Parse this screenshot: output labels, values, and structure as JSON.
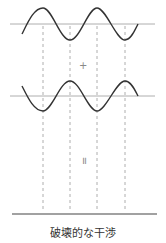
{
  "title": "破壊的な干渉",
  "operators": {
    "plus": "+",
    "equals": "="
  },
  "colors": {
    "wave": "#333333",
    "axis": "#999999",
    "dashed": "#999999",
    "result_line": "#444444",
    "text": "#333333"
  },
  "waves": [
    {
      "name": "wave-1",
      "axis_y": 24,
      "amplitude": 16,
      "phase": "peak-first",
      "x_start": 22,
      "x_end": 138
    },
    {
      "name": "wave-2",
      "axis_y": 96,
      "amplitude": 15,
      "phase": "trough-first",
      "x_start": 22,
      "x_end": 138
    }
  ],
  "dashed_lines_x": [
    43,
    70,
    97,
    125
  ],
  "result": {
    "description": "flat line (waves cancel)",
    "y": 214
  }
}
